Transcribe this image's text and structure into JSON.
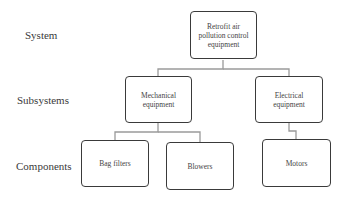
{
  "levels": {
    "system": "System",
    "subsystems": "Subsystems",
    "components": "Components"
  },
  "nodes": {
    "root": "Retrofit air pollution control equipment",
    "mechanical": "Mechanical equipment",
    "electrical": "Electrical equipment",
    "bag_filters": "Bag filters",
    "blowers": "Blowers",
    "motors": "Motors"
  }
}
